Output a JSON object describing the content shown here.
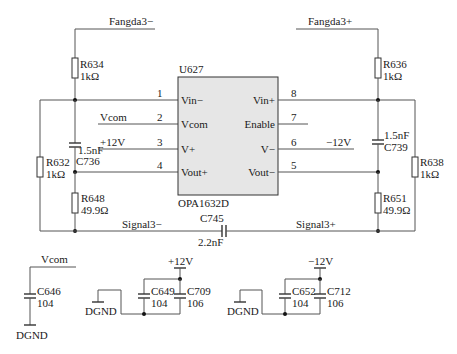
{
  "schematic": {
    "ic": {
      "ref": "U627",
      "part": "OPA1632D",
      "left_pins": [
        {
          "num": "1",
          "name": "Vin−",
          "net": ""
        },
        {
          "num": "2",
          "name": "Vcom",
          "net": "Vcom"
        },
        {
          "num": "3",
          "name": "V+",
          "net": "+12V"
        },
        {
          "num": "4",
          "name": "Vout+",
          "net": ""
        }
      ],
      "right_pins": [
        {
          "num": "8",
          "name": "Vin+",
          "net": ""
        },
        {
          "num": "7",
          "name": "Enable",
          "net": ""
        },
        {
          "num": "6",
          "name": "V−",
          "net": "−12V"
        },
        {
          "num": "5",
          "name": "Vout−",
          "net": ""
        }
      ]
    },
    "nets": {
      "fangda_minus": "Fangda3−",
      "fangda_plus": "Fangda3+",
      "signal_minus": "Signal3−",
      "signal_plus": "Signal3+"
    },
    "components": {
      "R634": {
        "ref": "R634",
        "value": "1kΩ"
      },
      "R636": {
        "ref": "R636",
        "value": "1kΩ"
      },
      "R632": {
        "ref": "R632",
        "value": "1kΩ"
      },
      "R638": {
        "ref": "R638",
        "value": "1kΩ"
      },
      "C736": {
        "ref": "C736",
        "value": "1.5nF"
      },
      "C739": {
        "ref": "C739",
        "value": "1.5nF"
      },
      "R648": {
        "ref": "R648",
        "value": "49.9Ω"
      },
      "R651": {
        "ref": "R651",
        "value": "49.9Ω"
      },
      "C745": {
        "ref": "C745",
        "value": "2.2nF"
      },
      "C646": {
        "ref": "C646",
        "value": "104"
      },
      "C649": {
        "ref": "C649",
        "value": "104"
      },
      "C709": {
        "ref": "C709",
        "value": "106"
      },
      "C652": {
        "ref": "C652",
        "value": "104"
      },
      "C712": {
        "ref": "C712",
        "value": "106"
      }
    },
    "decoupling": {
      "vcom_net": "Vcom",
      "pos_supply": "+12V",
      "neg_supply": "−12V",
      "ground": "DGND"
    }
  }
}
